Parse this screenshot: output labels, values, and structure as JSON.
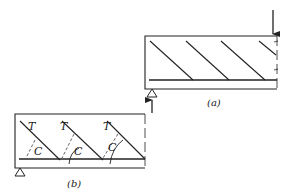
{
  "figure": {
    "panel_a": {
      "caption": "(a)"
    },
    "panel_b": {
      "caption": "(b)",
      "tension_label": "T",
      "compression_label": "C"
    }
  },
  "colors": {
    "ink": "#222222",
    "background": "#ffffff"
  }
}
